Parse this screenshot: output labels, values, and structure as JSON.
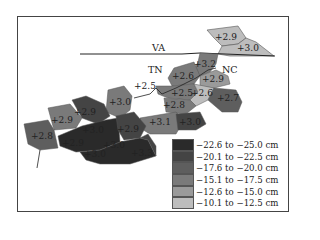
{
  "map": {
    "states": {
      "va": "VA",
      "tn": "TN",
      "nc": "NC"
    },
    "regions": [
      {
        "label": "+2.9",
        "x": 226,
        "y": 40
      },
      {
        "label": "+3.0",
        "x": 248,
        "y": 51
      },
      {
        "label": "+3.2",
        "x": 205,
        "y": 67
      },
      {
        "label": "+2.6",
        "x": 183,
        "y": 79
      },
      {
        "label": "+2.9",
        "x": 213,
        "y": 82
      },
      {
        "label": "+2.5",
        "x": 145,
        "y": 89
      },
      {
        "label": "+2.5",
        "x": 182,
        "y": 96
      },
      {
        "label": "+2.6",
        "x": 202,
        "y": 96
      },
      {
        "label": "+2.7",
        "x": 228,
        "y": 101
      },
      {
        "label": "+3.0",
        "x": 120,
        "y": 105
      },
      {
        "label": "+2.8",
        "x": 174,
        "y": 108
      },
      {
        "label": "+2.9",
        "x": 85,
        "y": 115
      },
      {
        "label": "+2.9",
        "x": 62,
        "y": 123
      },
      {
        "label": "+3.1",
        "x": 160,
        "y": 125
      },
      {
        "label": "+3.0",
        "x": 190,
        "y": 125
      },
      {
        "label": "+3.0",
        "x": 93,
        "y": 133
      },
      {
        "label": "+2.9",
        "x": 128,
        "y": 132
      },
      {
        "label": "+2.8",
        "x": 42,
        "y": 139
      },
      {
        "label": "+2.9",
        "x": 73,
        "y": 146
      },
      {
        "label": "+3.0",
        "x": 114,
        "y": 148
      },
      {
        "label": "+3.0",
        "x": 95,
        "y": 157
      },
      {
        "label": "+3.3",
        "x": 142,
        "y": 156
      }
    ]
  },
  "legend": {
    "items": [
      {
        "label": "−22.6 to −25.0 cm",
        "color": "#2a2a2a"
      },
      {
        "label": "−20.1 to −22.5 cm",
        "color": "#444444"
      },
      {
        "label": "−17.6 to −20.0 cm",
        "color": "#5e5e5e"
      },
      {
        "label": "−15.1 to −17.5 cm",
        "color": "#7a7a7a"
      },
      {
        "label": "−12.6 to −15.0 cm",
        "color": "#9a9a9a"
      },
      {
        "label": "−10.1 to −12.5 cm",
        "color": "#bdbdbd"
      }
    ]
  }
}
